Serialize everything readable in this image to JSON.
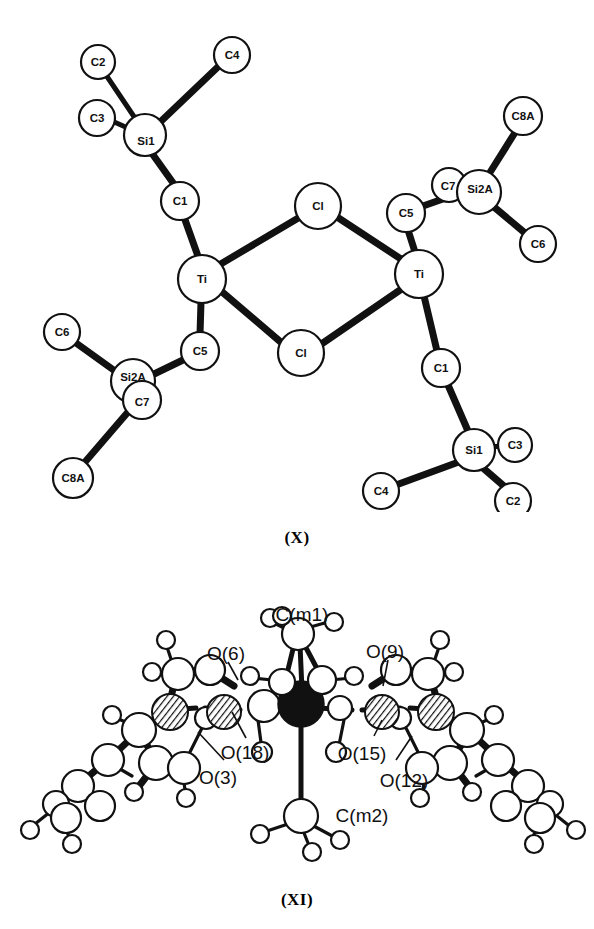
{
  "page": {
    "background_color": "#ffffff",
    "ink_color": "#111111",
    "figure_count": 2
  },
  "figures": [
    {
      "id": "figure-x",
      "caption": "(X)",
      "kind": "crystal-structure-ortep",
      "description": "Chloride-bridged dimer with two metal centres, each bearing two trimethylsilylmethyl-type ligands",
      "atom_labels": [
        "C2",
        "C4",
        "C3",
        "Si1",
        "C1",
        "Cl",
        "C5",
        "C7",
        "Si2A",
        "C8A",
        "C6",
        "Ti",
        "Ti",
        "Cl",
        "C5",
        "Si2A",
        "C7",
        "C6",
        "C8A",
        "C1",
        "Si1",
        "C3",
        "C2",
        "C4"
      ],
      "atoms": [
        {
          "label": "C2",
          "x": 98,
          "y": 62,
          "r": 17,
          "style": "open"
        },
        {
          "label": "C4",
          "x": 232,
          "y": 55,
          "r": 18,
          "style": "open"
        },
        {
          "label": "C3",
          "x": 97,
          "y": 118,
          "r": 18,
          "style": "open"
        },
        {
          "label": "Si1",
          "x": 145,
          "y": 135,
          "r": 21,
          "style": "open"
        },
        {
          "label": "C1",
          "x": 180,
          "y": 201,
          "r": 19,
          "style": "open"
        },
        {
          "label": "Ti",
          "x": 202,
          "y": 279,
          "r": 24,
          "style": "open"
        },
        {
          "label": "Cl",
          "x": 318,
          "y": 206,
          "r": 23,
          "style": "open"
        },
        {
          "label": "Cl",
          "x": 301,
          "y": 353,
          "r": 23,
          "style": "open"
        },
        {
          "label": "Ti",
          "x": 419,
          "y": 274,
          "r": 24,
          "style": "open"
        },
        {
          "label": "C5",
          "x": 406,
          "y": 213,
          "r": 19,
          "style": "open"
        },
        {
          "label": "C7",
          "x": 449,
          "y": 185,
          "r": 17,
          "style": "open"
        },
        {
          "label": "Si2A",
          "x": 479,
          "y": 192,
          "r": 22,
          "style": "open"
        },
        {
          "label": "C8A",
          "x": 523,
          "y": 116,
          "r": 19,
          "style": "open"
        },
        {
          "label": "C6",
          "x": 538,
          "y": 244,
          "r": 18,
          "style": "open"
        },
        {
          "label": "C5",
          "x": 200,
          "y": 351,
          "r": 19,
          "style": "open"
        },
        {
          "label": "Si2A",
          "x": 133,
          "y": 381,
          "r": 22,
          "style": "open"
        },
        {
          "label": "C7",
          "x": 142,
          "y": 400,
          "r": 19,
          "style": "open"
        },
        {
          "label": "C6",
          "x": 62,
          "y": 332,
          "r": 18,
          "style": "open"
        },
        {
          "label": "C8A",
          "x": 73,
          "y": 478,
          "r": 20,
          "style": "open"
        },
        {
          "label": "C1",
          "x": 441,
          "y": 368,
          "r": 19,
          "style": "open"
        },
        {
          "label": "Si1",
          "x": 474,
          "y": 450,
          "r": 21,
          "style": "open"
        },
        {
          "label": "C3",
          "x": 515,
          "y": 445,
          "r": 17,
          "style": "open"
        },
        {
          "label": "C2",
          "x": 513,
          "y": 501,
          "r": 18,
          "style": "open"
        },
        {
          "label": "C4",
          "x": 381,
          "y": 491,
          "r": 18,
          "style": "open"
        }
      ],
      "bonds": [
        {
          "from": "C2-top",
          "to": "Si1-top"
        },
        {
          "from": "C4-top",
          "to": "Si1-top"
        },
        {
          "from": "C3-top",
          "to": "Si1-top"
        },
        {
          "from": "Si1-top",
          "to": "C1-top"
        },
        {
          "from": "C1-top",
          "to": "Ti-left"
        },
        {
          "from": "Ti-left",
          "to": "Cl-upper"
        },
        {
          "from": "Ti-left",
          "to": "Cl-lower"
        },
        {
          "from": "Cl-upper",
          "to": "Ti-right"
        },
        {
          "from": "Cl-lower",
          "to": "Ti-right"
        },
        {
          "from": "Ti-left",
          "to": "C5-left"
        },
        {
          "from": "C5-left",
          "to": "Si2A-left"
        },
        {
          "from": "Si2A-left",
          "to": "C6-left"
        },
        {
          "from": "Si2A-left",
          "to": "C8A-left"
        },
        {
          "from": "Ti-right",
          "to": "C5-right"
        },
        {
          "from": "C5-right",
          "to": "Si2A-right"
        },
        {
          "from": "Si2A-right",
          "to": "C8A-right"
        },
        {
          "from": "Si2A-right",
          "to": "C6-right"
        },
        {
          "from": "Ti-right",
          "to": "C1-bottom"
        },
        {
          "from": "C1-bottom",
          "to": "Si1-bottom"
        },
        {
          "from": "Si1-bottom",
          "to": "C3-bottom"
        },
        {
          "from": "Si1-bottom",
          "to": "C2-bottom"
        },
        {
          "from": "Si1-bottom",
          "to": "C4-bottom"
        }
      ]
    },
    {
      "id": "figure-xi",
      "caption": "(XI)",
      "kind": "crystal-structure-ortep",
      "description": "Polyoxometalate-like cluster with central metal atoms, bridging oxygens and two methyl groups",
      "atom_labels": [
        "C(m1)",
        "O(6)",
        "O(9)",
        "O(18)",
        "O(15)",
        "O(3)",
        "O(12)",
        "C(m2)"
      ],
      "callouts": [
        {
          "label": "C(m1)",
          "x": 302,
          "y": 614,
          "anchor": "middle"
        },
        {
          "label": "O(6)",
          "x": 233,
          "y": 683,
          "anchor": "middle"
        },
        {
          "label": "O(9)",
          "x": 384,
          "y": 681,
          "anchor": "middle"
        },
        {
          "label": "O(18)",
          "x": 247,
          "y": 752,
          "anchor": "middle"
        },
        {
          "label": "O(15)",
          "x": 357,
          "y": 753,
          "anchor": "middle"
        },
        {
          "label": "O(3)",
          "x": 219,
          "y": 777,
          "anchor": "middle"
        },
        {
          "label": "O(12)",
          "x": 399,
          "y": 780,
          "anchor": "middle"
        },
        {
          "label": "C(m2)",
          "x": 365,
          "y": 845,
          "anchor": "middle"
        }
      ]
    }
  ]
}
